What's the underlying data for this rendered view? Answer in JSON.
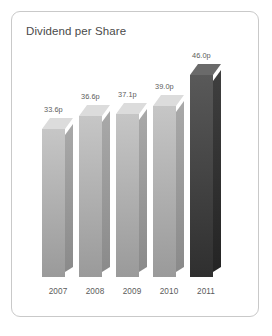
{
  "card": {
    "title": "Dividend per Share"
  },
  "chart_data": {
    "type": "bar",
    "title": "Dividend per Share",
    "xlabel": "",
    "ylabel": "",
    "unit": "p",
    "grid": false,
    "legend": null,
    "style": "3d-extruded-column",
    "ylim": [
      0,
      46
    ],
    "categories": [
      "2007",
      "2008",
      "2009",
      "2010",
      "2011"
    ],
    "values": [
      33.6,
      36.6,
      37.1,
      39.0,
      46.0
    ],
    "data_labels": [
      "33.6p",
      "36.6p",
      "37.1p",
      "39.0p",
      "46.0p"
    ],
    "series": [
      {
        "name": "Dividend per Share",
        "values": [
          33.6,
          36.6,
          37.1,
          39.0,
          46.0
        ]
      }
    ],
    "bar_colors": [
      "#b4b4b4",
      "#b4b4b4",
      "#b4b4b4",
      "#b4b4b4",
      "#4a4a4a"
    ],
    "highlight_category": "2011"
  },
  "colors": {
    "card_border": "#c9c9c9",
    "card_background": "#ffffff",
    "title_text": "#4a4a4a",
    "axis_text": "#5b5b5b",
    "bar_light": "#b4b4b4",
    "bar_dark": "#4a4a4a"
  }
}
